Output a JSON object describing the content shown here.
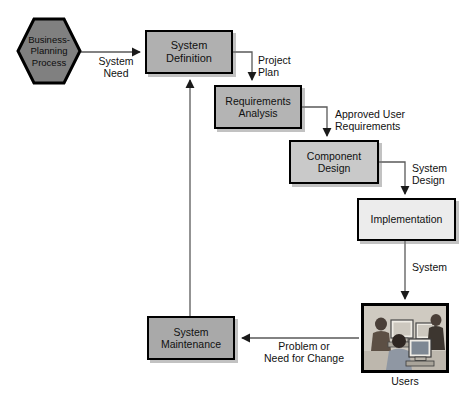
{
  "diagram": {
    "colors": {
      "hexagon_fill": "#808080",
      "stage_fill_dark": "#b0b0b0",
      "stage_fill_mid": "#c9c9c9",
      "stage_fill_light": "#ececec",
      "border": "#000000",
      "connector": "#595959",
      "text": "#111111"
    },
    "nodes": [
      {
        "id": "business-planning-process",
        "label": "Business-\nPlanning\nProcess",
        "shape": "hexagon"
      },
      {
        "id": "system-definition",
        "label": "System\nDefinition",
        "shape": "rectangle"
      },
      {
        "id": "requirements-analysis",
        "label": "Requirements\nAnalysis",
        "shape": "rectangle"
      },
      {
        "id": "component-design",
        "label": "Component\nDesign",
        "shape": "rectangle"
      },
      {
        "id": "implementation",
        "label": "Implementation",
        "shape": "rectangle"
      },
      {
        "id": "system-maintenance",
        "label": "System\nMaintenance",
        "shape": "rectangle"
      },
      {
        "id": "users",
        "label": "Users",
        "shape": "image"
      }
    ],
    "edge_labels": [
      {
        "id": "system-need",
        "text": "System\nNeed"
      },
      {
        "id": "project-plan",
        "text": "Project\nPlan"
      },
      {
        "id": "approved-user-requirements",
        "text": "Approved User\nRequirements"
      },
      {
        "id": "system-design",
        "text": "System\nDesign"
      },
      {
        "id": "system",
        "text": "System"
      },
      {
        "id": "problem-or-need-for-change",
        "text": "Problem or\nNeed for Change"
      }
    ]
  }
}
